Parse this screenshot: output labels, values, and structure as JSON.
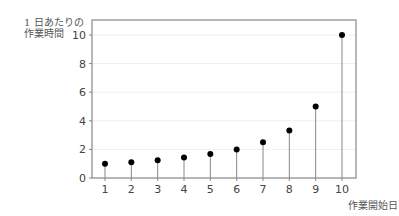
{
  "chart_data": {
    "type": "scatter",
    "style": "stem",
    "title": "",
    "ylabel_line1": "1 日あたりの",
    "ylabel_line2": "作業時間",
    "xlabel": "作業開始日",
    "x": [
      1,
      2,
      3,
      4,
      5,
      6,
      7,
      8,
      9,
      10
    ],
    "values": [
      1.0,
      1.11,
      1.25,
      1.43,
      1.67,
      2.0,
      2.5,
      3.33,
      5.0,
      10.0
    ],
    "xticks": [
      "1",
      "2",
      "3",
      "4",
      "5",
      "6",
      "7",
      "8",
      "9",
      "10"
    ],
    "yticks": [
      "0",
      "2",
      "4",
      "6",
      "8",
      "10"
    ],
    "ylim": [
      0,
      10.5
    ],
    "grid": true,
    "colors": {
      "point": "#000000",
      "stem": "#888888",
      "axis": "#888888",
      "grid": "#eeeeee"
    }
  }
}
